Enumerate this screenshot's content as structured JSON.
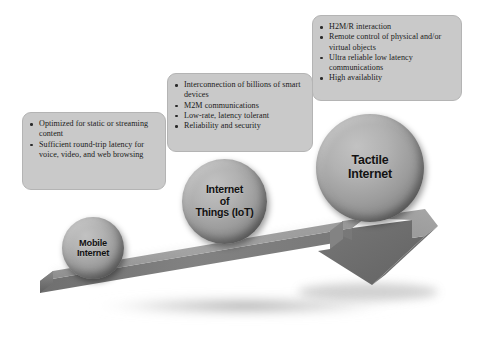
{
  "diagram": {
    "arrow_name": "rising-3d-arrow",
    "colors": {
      "callout_fill": "#c9c9c9",
      "callout_border": "#b4b4b4",
      "arrow_top_face": "#9a9a9a",
      "arrow_front_face": "#7e7e7e",
      "arrow_side_face": "#6f6f6f",
      "sphere_light": "#c2c2c2",
      "sphere_dark": "#6a6a6a",
      "text": "#1a1a1a"
    }
  },
  "stages": [
    {
      "id": "mobile",
      "sphere_label": "Mobile\nInternet",
      "bullets": [
        "Optimized for static or streaming content",
        "Sufficient round-trip latency for voice, video, and web browsing"
      ]
    },
    {
      "id": "iot",
      "sphere_label": "Internet\nof\nThings (IoT)",
      "bullets": [
        "Interconnection of billions of smart devices",
        "M2M communications",
        "Low-rate, latency tolerant",
        "Reliability and security"
      ]
    },
    {
      "id": "tactile",
      "sphere_label": "Tactile\nInternet",
      "bullets": [
        "H2M/R interaction",
        "Remote control of physical and/or virtual objects",
        "Ultra reliable low latency communications",
        "High availablity"
      ]
    }
  ]
}
